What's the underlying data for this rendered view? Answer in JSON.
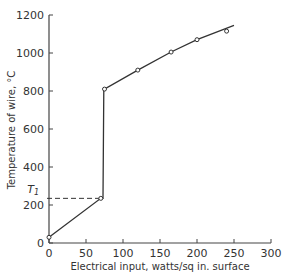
{
  "chart_data": {
    "type": "line",
    "title": "",
    "xlabel": "Electrical input, watts/sq in. surface",
    "ylabel": "Temperature of wire, °C",
    "xlim": [
      0,
      300
    ],
    "ylim": [
      0,
      1200
    ],
    "x_ticks": [
      0,
      50,
      100,
      150,
      200,
      250,
      300
    ],
    "y_ticks": [
      0,
      200,
      400,
      600,
      800,
      1000,
      1200
    ],
    "x_tick_labels": [
      "0",
      "50",
      "100",
      "150",
      "200",
      "250",
      "300"
    ],
    "y_tick_labels": [
      "0",
      "200",
      "400",
      "600",
      "800",
      "1000",
      "1200"
    ],
    "grid": false,
    "legend": null,
    "series": [
      {
        "name": "Wire temperature",
        "points": [
          [
            0,
            30
          ],
          [
            70,
            235
          ],
          [
            75,
            810
          ],
          [
            120,
            910
          ],
          [
            165,
            1005
          ],
          [
            200,
            1070
          ],
          [
            240,
            1115
          ]
        ],
        "curve": [
          [
            0,
            30
          ],
          [
            70,
            235
          ],
          [
            73,
            235
          ],
          [
            74,
            810
          ],
          [
            75,
            810
          ],
          [
            120,
            910
          ],
          [
            165,
            1005
          ],
          [
            200,
            1070
          ],
          [
            250,
            1145
          ]
        ],
        "marker": "open-circle"
      }
    ],
    "annotations": [
      {
        "type": "hline-dashed",
        "label": "T₁",
        "y": 235,
        "x_from": 0,
        "x_to": 70
      }
    ]
  },
  "labels": {
    "t1": "T",
    "t1_sub": "1"
  },
  "colors": {
    "line": "#333333",
    "axis": "#444444",
    "background": "#ffffff"
  }
}
